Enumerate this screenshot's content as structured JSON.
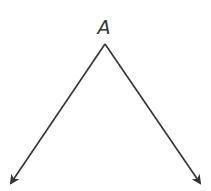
{
  "diagram": {
    "type": "angle",
    "vertex": {
      "label": "A",
      "x": 105,
      "y": 44
    },
    "rays": [
      {
        "name": "left-ray",
        "end": {
          "x": 10,
          "y": 184
        }
      },
      {
        "name": "right-ray",
        "end": {
          "x": 201,
          "y": 184
        }
      }
    ],
    "stroke_color": "#333333"
  }
}
